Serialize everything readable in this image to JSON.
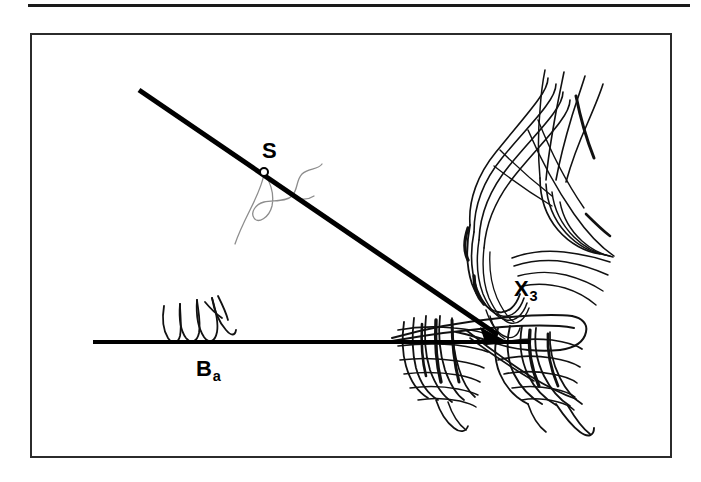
{
  "figure": {
    "background_color": "#ffffff",
    "ink_color": "#000000",
    "frame": {
      "name": "figure-border",
      "stroke_color": "#2b2b2b",
      "x": 30,
      "y": 33,
      "width": 642,
      "height": 425
    },
    "top_rule": {
      "name": "page-top-rule",
      "color": "#1a1a1a",
      "x": 28,
      "y": 4,
      "width": 662,
      "height": 3
    },
    "labels": [
      {
        "id": "s",
        "base": "S",
        "sub": "",
        "x": 262,
        "y": 140
      },
      {
        "id": "x3",
        "base": "X",
        "sub": "3",
        "x": 514,
        "y": 278
      },
      {
        "id": "ba",
        "base": "B",
        "sub": "a",
        "x": 196,
        "y": 358
      }
    ],
    "lines": {
      "baseline": {
        "name": "horizontal-baseline",
        "x1": 93,
        "y1": 342,
        "x2": 530,
        "y2": 342,
        "stroke": "#000000",
        "width": 4
      },
      "ray": {
        "name": "diagonal-ray",
        "x1": 139,
        "y1": 90,
        "x2": 508,
        "y2": 342,
        "stroke": "#000000",
        "width": 5,
        "arrowhead": true
      }
    },
    "markers": {
      "s_point": {
        "name": "point-marker-s",
        "cx": 264,
        "cy": 172,
        "r": 4,
        "stroke": "#000000",
        "fill": "#ffffff"
      }
    },
    "sketches": [
      {
        "id": "hand-sketch-upper-right",
        "x": 440,
        "y": 58,
        "width": 180,
        "height": 196
      },
      {
        "id": "cluster-sketch-lower-right",
        "x": 388,
        "y": 296,
        "width": 210,
        "height": 146
      },
      {
        "id": "squiggle-on-baseline",
        "x": 158,
        "y": 300,
        "width": 78,
        "height": 44
      },
      {
        "id": "thin-squiggle-near-s",
        "x": 232,
        "y": 160,
        "width": 104,
        "height": 96
      }
    ]
  }
}
